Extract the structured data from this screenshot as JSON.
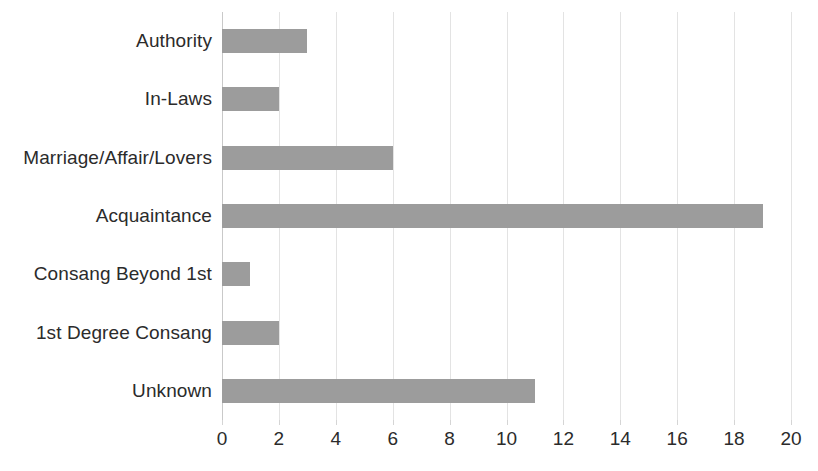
{
  "chart_data": {
    "type": "bar",
    "orientation": "horizontal",
    "title": "",
    "subtitle": "",
    "xlabel": "",
    "ylabel": "",
    "categories": [
      "Authority",
      "In-Laws",
      "Marriage/Affair/Lovers",
      "Acquaintance",
      "Consang Beyond 1st",
      "1st Degree Consang",
      "Unknown"
    ],
    "values": [
      3,
      2,
      6,
      19,
      1,
      2,
      11
    ],
    "xlim": [
      0,
      20
    ],
    "xticks": [
      0,
      2,
      4,
      6,
      8,
      10,
      12,
      14,
      16,
      18,
      20
    ],
    "xtick_labels": [
      "0",
      "2",
      "4",
      "6",
      "8",
      "10",
      "12",
      "14",
      "16",
      "18",
      "20"
    ],
    "xtick_step": 2,
    "grid": "vertical-only",
    "legend": "none",
    "bar_color": "#9c9c9c",
    "gridline_color": "#e3e3e3",
    "axis_color": "#c9c9c9",
    "text_color": "#2b2b2b",
    "background_color": "#ffffff"
  }
}
